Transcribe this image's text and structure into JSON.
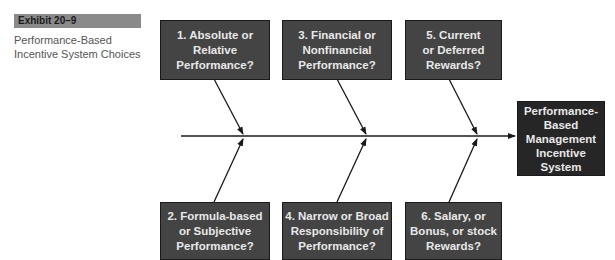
{
  "exhibit": {
    "label": "Exhibit 20–9",
    "caption": "Performance-Based\nIncentive System Choices"
  },
  "diagram": {
    "type": "fishbone",
    "top_causes": [
      {
        "id": 1,
        "text": "1. Absolute or\nRelative\nPerformance?"
      },
      {
        "id": 3,
        "text": "3. Financial or\nNonfinancial\nPerformance?"
      },
      {
        "id": 5,
        "text": "5. Current\nor Deferred\nRewards?"
      }
    ],
    "bottom_causes": [
      {
        "id": 2,
        "text": "2. Formula-based\nor Subjective\nPerformance?"
      },
      {
        "id": 4,
        "text": "4. Narrow or Broad\nResponsibility of\nPerformance?"
      },
      {
        "id": 6,
        "text": "6. Salary, or\nBonus, or stock\nRewards?"
      }
    ],
    "effect": {
      "text": "Performance-\nBased\nManagement\nIncentive\nSystem"
    },
    "colors": {
      "box_fill": "#444444",
      "effect_fill": "#262626",
      "box_text": "#e8e8e8",
      "line": "#1a1a1a",
      "exhibit_bar": "#8a8a8a"
    }
  }
}
